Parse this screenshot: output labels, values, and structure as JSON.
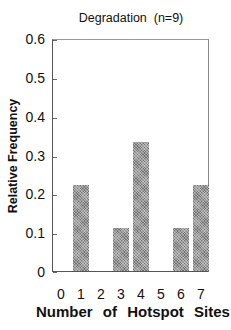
{
  "chart_data": {
    "type": "bar",
    "title": "Degradation  (n=9)",
    "xlabel": "Number of Hotspot Sites",
    "ylabel": "Relative Frequency",
    "categories": [
      "0",
      "1",
      "2",
      "3",
      "4",
      "5",
      "6",
      "7"
    ],
    "values": [
      0,
      0.222,
      0,
      0.111,
      0.333,
      0,
      0.111,
      0.222
    ],
    "ylim": [
      0,
      0.6
    ],
    "yticks": [
      "0",
      "0.1",
      "0.2",
      "0.3",
      "0.4",
      "0.5",
      "0.6"
    ],
    "grid": false,
    "legend": null,
    "bar_color": "#9a9a9a"
  }
}
